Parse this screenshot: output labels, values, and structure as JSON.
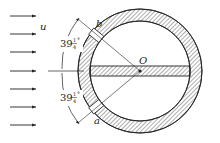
{
  "diagram": {
    "type": "cross-section",
    "labels": {
      "flow_velocity": "u",
      "center": "O",
      "point_upper": "b",
      "point_lower": "a",
      "angle_upper_whole": "39",
      "angle_upper_frac_num": "1",
      "angle_upper_frac_den": "4",
      "angle_lower_whole": "39",
      "angle_lower_frac_num": "1",
      "angle_lower_frac_den": "4",
      "degree": "°"
    },
    "angle_value": "39 1/4°",
    "flow_arrow_count": 7,
    "colors": {
      "stroke": "#222222",
      "hatch": "#333333",
      "background": "#ffffff"
    }
  }
}
